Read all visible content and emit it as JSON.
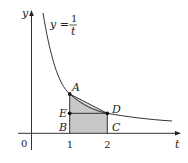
{
  "diagram": {
    "curve_label": {
      "lhs": "y =",
      "numerator": "1",
      "denominator": "t"
    },
    "axis_labels": {
      "x": "t",
      "y": "y",
      "origin": "0"
    },
    "tick_labels": [
      "1",
      "2"
    ],
    "points": [
      {
        "name": "A",
        "x": 1,
        "y": 1
      },
      {
        "name": "B",
        "x": 1,
        "y": 0
      },
      {
        "name": "C",
        "x": 2,
        "y": 0
      },
      {
        "name": "D",
        "x": 2,
        "y": 0.5
      },
      {
        "name": "E",
        "x": 1,
        "y": 0.5
      }
    ],
    "colors": {
      "shade": "#c8c8c8",
      "line": "#333333"
    }
  }
}
